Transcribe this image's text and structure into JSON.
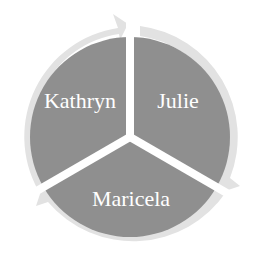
{
  "diagram": {
    "type": "cycle",
    "colors": {
      "background": "#ffffff",
      "segment": "#8f8f8f",
      "arrow_ring": "#e2e2e2",
      "separator": "#ffffff",
      "label": "#ffffff"
    },
    "segments": [
      {
        "label": "Julie",
        "position": "top-right"
      },
      {
        "label": "Maricela",
        "position": "bottom"
      },
      {
        "label": "Kathryn",
        "position": "top-left"
      }
    ],
    "direction": "clockwise"
  }
}
